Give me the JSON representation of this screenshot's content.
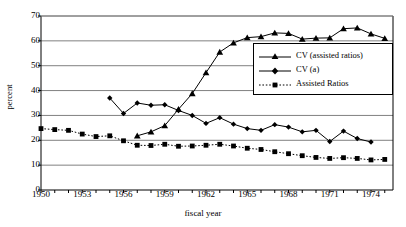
{
  "chart_data": {
    "type": "line",
    "title": "",
    "xlabel": "fiscal year",
    "ylabel": "percent",
    "xlim": [
      1950,
      1975.6
    ],
    "ylim": [
      0,
      70
    ],
    "ytick_values": [
      0,
      10,
      20,
      30,
      40,
      50,
      60,
      70
    ],
    "ytick_labels": [
      "0",
      "10",
      "20",
      "30",
      "40",
      "50",
      "60",
      "70"
    ],
    "xtick_values": [
      1950,
      1953,
      1956,
      1959,
      1962,
      1965,
      1968,
      1971,
      1974
    ],
    "xtick_labels": [
      "1950",
      "1953",
      "1956",
      "1959",
      "1962",
      "1965",
      "1968",
      "1971",
      "1974"
    ],
    "xtick_minor_step": 1,
    "grid": "horizontal",
    "grid_color": "#808080",
    "legend_position": "center-right",
    "series": [
      {
        "name": "CV (assisted ratios)",
        "marker": "triangle",
        "linestyle": "solid",
        "color": "#000000",
        "x": [
          1957,
          1958,
          1959,
          1960,
          1961,
          1962,
          1963,
          1964,
          1965,
          1966,
          1967,
          1968,
          1969,
          1970,
          1971,
          1972,
          1973,
          1974,
          1975
        ],
        "values": [
          21.8,
          23.4,
          25.9,
          32.5,
          38.8,
          47.2,
          55.5,
          59.2,
          61.3,
          61.7,
          63.2,
          63.0,
          60.7,
          61.1,
          61.2,
          64.9,
          65.2,
          62.8,
          61.0
        ]
      },
      {
        "name": "CV (a)",
        "marker": "diamond",
        "linestyle": "solid",
        "color": "#000000",
        "x": [
          1955,
          1956,
          1957,
          1958,
          1959,
          1960,
          1961,
          1962,
          1963,
          1964,
          1965,
          1966,
          1967,
          1968,
          1969,
          1970,
          1971,
          1972,
          1973,
          1974
        ],
        "values": [
          37.0,
          30.8,
          35.0,
          34.1,
          34.3,
          32.0,
          30.0,
          26.8,
          29.1,
          26.5,
          24.7,
          24.0,
          26.3,
          25.3,
          23.4,
          24.0,
          19.5,
          23.7,
          20.7,
          19.3
        ]
      },
      {
        "name": "Assisted Ratios",
        "marker": "square",
        "linestyle": "dotted",
        "color": "#000000",
        "x": [
          1950,
          1951,
          1952,
          1953,
          1954,
          1955,
          1956,
          1957,
          1958,
          1959,
          1960,
          1961,
          1962,
          1963,
          1964,
          1965,
          1966,
          1967,
          1968,
          1969,
          1970,
          1971,
          1972,
          1973,
          1974,
          1975
        ],
        "values": [
          24.7,
          24.3,
          24.0,
          22.5,
          21.5,
          21.8,
          19.8,
          18.0,
          17.9,
          18.4,
          17.6,
          17.7,
          18.0,
          18.4,
          17.7,
          16.8,
          16.3,
          15.4,
          14.6,
          13.8,
          13.1,
          12.7,
          13.0,
          12.7,
          12.1,
          12.3
        ]
      }
    ]
  },
  "legend": {
    "items": [
      {
        "label": "CV (assisted ratios)"
      },
      {
        "label": "CV (a)"
      },
      {
        "label": "Assisted Ratios"
      }
    ]
  }
}
